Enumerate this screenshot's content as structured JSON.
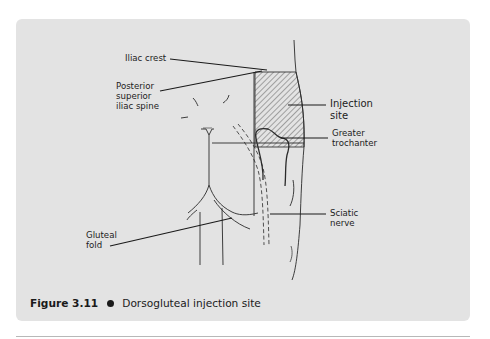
{
  "figure": {
    "number": "Figure 3.11",
    "title": "Dorsogluteal injection site",
    "panel_color": "#e3e3e3",
    "hatch_color": "#333333"
  },
  "labels": {
    "iliac_crest": {
      "line1": "Iliac crest"
    },
    "psis": {
      "line1": "Posterior",
      "line2": "superior",
      "line3": "iliac spine"
    },
    "injection_site": {
      "line1": "Injection",
      "line2": "site"
    },
    "greater_trochanter": {
      "line1": "Greater",
      "line2": "trochanter"
    },
    "sciatic_nerve": {
      "line1": "Sciatic",
      "line2": "nerve"
    },
    "gluteal_fold": {
      "line1": "Gluteal",
      "line2": "fold"
    }
  }
}
